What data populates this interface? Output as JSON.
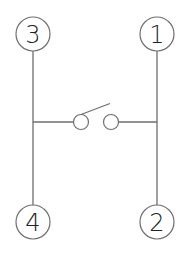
{
  "diagram": {
    "type": "switch-schematic",
    "colors": {
      "line": "#6e6e6e",
      "text": "#222222",
      "background": "#ffffff"
    },
    "terminals": [
      {
        "id": "t3",
        "label": "3",
        "position": "top-left"
      },
      {
        "id": "t1",
        "label": "1",
        "position": "top-right"
      },
      {
        "id": "t4",
        "label": "4",
        "position": "bottom-left"
      },
      {
        "id": "t2",
        "label": "2",
        "position": "bottom-right"
      }
    ],
    "switch": {
      "state": "open",
      "left_contact": "contact-left",
      "right_contact": "contact-right"
    },
    "connections": [
      {
        "from": "3",
        "to": "4",
        "note": "left rail"
      },
      {
        "from": "1",
        "to": "2",
        "note": "right rail"
      },
      {
        "from": "left rail",
        "to": "right rail",
        "via": "open switch"
      }
    ]
  }
}
